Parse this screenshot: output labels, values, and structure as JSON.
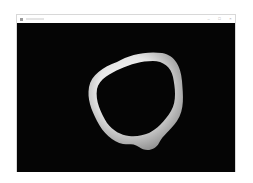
{
  "window": {
    "title": "",
    "controls": {
      "minimize": "–",
      "maximize": "□",
      "close": "×"
    }
  },
  "viewport": {
    "background": "#050505",
    "object": {
      "type": "ring-mesh",
      "color": "#e8e8e8",
      "shade_color": "#9a9a9a"
    }
  }
}
